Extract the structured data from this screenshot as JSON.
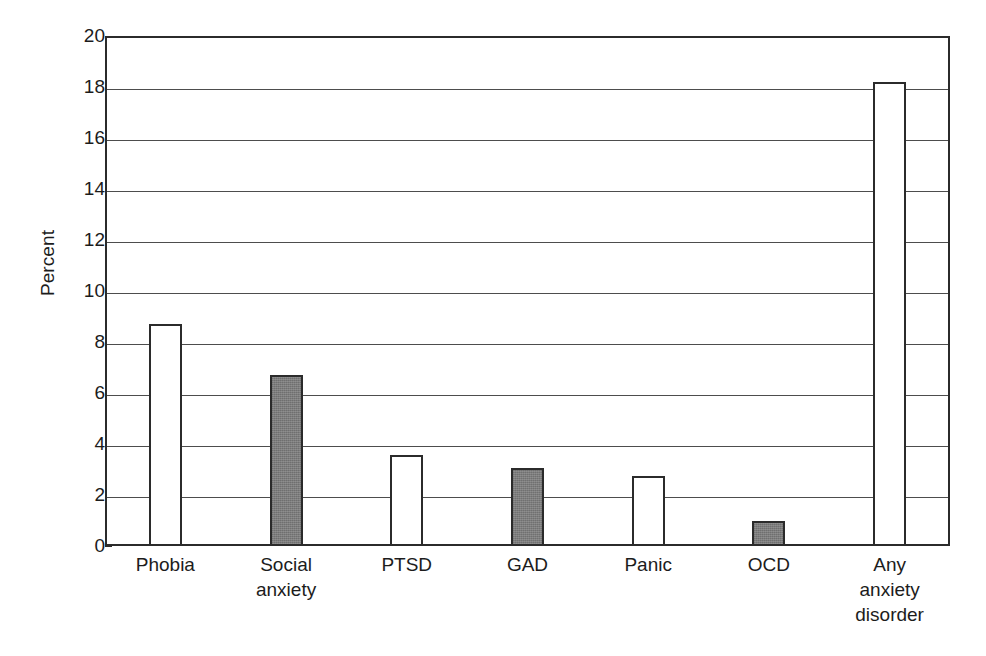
{
  "chart_data": {
    "type": "bar",
    "title": "",
    "subtitle": "",
    "xlabel": "",
    "ylabel": "Percent",
    "categories": [
      "Phobia",
      "Social anxiety",
      "PTSD",
      "GAD",
      "Panic",
      "OCD",
      "Any anxiety disorder"
    ],
    "category_lines": [
      [
        "Phobia"
      ],
      [
        "Social",
        "anxiety"
      ],
      [
        "PTSD"
      ],
      [
        "GAD"
      ],
      [
        "Panic"
      ],
      [
        "OCD"
      ],
      [
        "Any",
        "anxiety",
        "disorder"
      ]
    ],
    "values": [
      8.7,
      6.7,
      3.55,
      3.05,
      2.75,
      1.0,
      18.2
    ],
    "bar_fills": [
      "white",
      "gray",
      "white",
      "gray",
      "white",
      "gray",
      "white"
    ],
    "ylim": [
      0,
      20
    ],
    "yticks": [
      0,
      2,
      4,
      6,
      8,
      10,
      12,
      14,
      16,
      18,
      20
    ],
    "ytick_labels": [
      "0",
      "2",
      "4",
      "6",
      "8",
      "10",
      "12",
      "14",
      "16",
      "18",
      "20"
    ],
    "grid": true,
    "grid_axis": "y",
    "legend": "none",
    "colors": {
      "bar_white": "#ffffff",
      "bar_gray": "#7c7c7c",
      "bar_outline": "#2b2b2b",
      "gridline": "#4d4d4d",
      "axis": "#2b2b2b",
      "background": "#ffffff",
      "text": "#1c1c1c"
    }
  }
}
